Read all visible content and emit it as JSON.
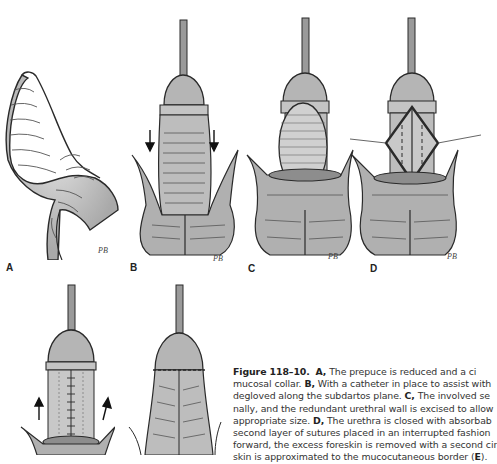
{
  "figure": {
    "number": "Figure 118–10.",
    "panels": [
      {
        "label": "A",
        "signature": "PB"
      },
      {
        "label": "B",
        "signature": "PB"
      },
      {
        "label": "C",
        "signature": "PB"
      },
      {
        "label": "D",
        "signature": "PB"
      },
      {
        "label": "E",
        "signature": ""
      },
      {
        "label": "F",
        "signature": ""
      }
    ],
    "caption_lines": [
      {
        "parts": [
          {
            "b": "Figure 118–10."
          },
          {
            "t": "  "
          },
          {
            "b": "A,"
          },
          {
            "t": " The prepuce is reduced and a ci"
          }
        ]
      },
      {
        "parts": [
          {
            "t": "mucosal collar. "
          },
          {
            "b": "B,"
          },
          {
            "t": " With a catheter in place to assist with"
          }
        ]
      },
      {
        "parts": [
          {
            "t": "degloved along the subdartos plane. "
          },
          {
            "b": "C,"
          },
          {
            "t": " The involved se"
          }
        ]
      },
      {
        "parts": [
          {
            "t": "nally, and the redundant urethral wall is excised to allow"
          }
        ]
      },
      {
        "parts": [
          {
            "t": "appropriate size. "
          },
          {
            "b": "D,"
          },
          {
            "t": " The urethra is closed with absorbab"
          }
        ]
      },
      {
        "parts": [
          {
            "t": "second layer of sutures placed in an interrupted fashion"
          }
        ]
      },
      {
        "parts": [
          {
            "t": "forward, the excess foreskin is removed with a second cir"
          }
        ]
      },
      {
        "parts": [
          {
            "t": "skin is approximated to the mucocutaneous border ("
          },
          {
            "b": "E"
          },
          {
            "t": ")."
          }
        ]
      }
    ]
  },
  "colors": {
    "skin_fill": "#b9b9b9",
    "skin_light": "#d8d8d8",
    "outline": "#2a2a2a",
    "catheter": "#9a9a9a",
    "text": "#333333"
  }
}
